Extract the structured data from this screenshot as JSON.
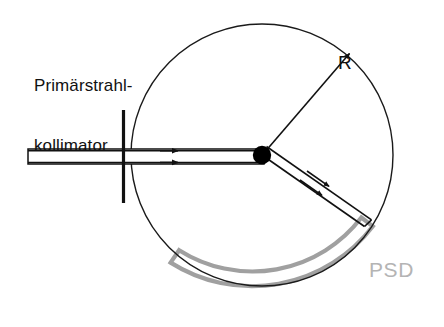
{
  "figure": {
    "kind": "schematic-diagram",
    "background_color": "#ffffff",
    "width": 444,
    "height": 327
  },
  "labels": {
    "collimator": "Primärstrahl-\nkollimator",
    "collimator_line1": "Primärstrahl-",
    "collimator_line2": "kollimator",
    "radius": "R",
    "detector": "PSD"
  },
  "colors": {
    "stroke_dark": "#111111",
    "stroke_circle": "#1a1a1a",
    "detector_gray": "#a0a0a0",
    "detector_text_gray": "#b4b4b4",
    "sample_fill": "#000000"
  },
  "geometry": {
    "measuring_circle": {
      "center_x": 262,
      "center_y": 155,
      "radius": 131,
      "stroke_width": 1.4
    },
    "sample": {
      "center_x": 262,
      "center_y": 155,
      "radius": 9
    },
    "primary_beam_tube": {
      "x": 28,
      "y": 149,
      "width": 236,
      "height": 15
    },
    "collimator_slit": {
      "x": 122,
      "y_top": 110,
      "y_bottom": 203,
      "width": 3
    },
    "incident_rays": {
      "count": 2,
      "y_values": [
        150.5,
        162.5
      ],
      "arrow_x": 175
    },
    "diffracted_beam": {
      "angle_deg": 41,
      "start_x": 262,
      "start_y": 155,
      "end_x": 370,
      "end_y": 224,
      "arrow_count": 2
    },
    "radius_arrow": {
      "from_x": 262,
      "from_y": 155,
      "to_x": 351,
      "to_y": 52
    },
    "psd_arc": {
      "center_x": 262,
      "center_y": 155,
      "inner_radius": 137,
      "outer_radius": 152,
      "start_angle_deg": 33,
      "end_angle_deg": 143,
      "stroke_width": 4
    }
  },
  "parts": [
    {
      "name": "primary-beam-collimator",
      "label": "Primärstrahl-kollimator"
    },
    {
      "name": "measuring-circle",
      "label": "R"
    },
    {
      "name": "position-sensitive-detector",
      "label": "PSD"
    }
  ]
}
